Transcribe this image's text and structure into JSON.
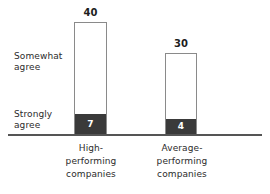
{
  "chart_data": {
    "type": "bar",
    "subtype": "stacked-bar",
    "title": "",
    "subtitle": "",
    "xlabel": "",
    "ylabel": "",
    "ylim": [
      0,
      45
    ],
    "grid": false,
    "legend_position": "left-axis-labels",
    "categories": [
      "High-performing companies",
      "Average-performing companies"
    ],
    "series": [
      {
        "name": "Strongly agree",
        "values": [
          7,
          4
        ],
        "color": "#3a3a3a"
      },
      {
        "name": "Somewhat agree",
        "values": [
          33,
          26
        ],
        "color": "#ffffff"
      }
    ],
    "totals": [
      40,
      30
    ],
    "annotations": {
      "total_labels": [
        "40",
        "30"
      ],
      "segment_labels": [
        "7",
        "4"
      ]
    }
  },
  "legend": {
    "somewhat": {
      "line1": "Somewhat",
      "line2": "agree"
    },
    "strongly": {
      "line1": "Strongly",
      "line2": "agree"
    }
  },
  "bars": {
    "bar1": {
      "total_label": "40",
      "bottom_value": "7",
      "category": {
        "line1": "High-",
        "line2": "performing",
        "line3": "companies"
      }
    },
    "bar2": {
      "total_label": "30",
      "bottom_value": "4",
      "category": {
        "line1": "Average-",
        "line2": "performing",
        "line3": "companies"
      }
    }
  },
  "colors": {
    "strongly_agree_fill": "#3a3a3a",
    "somewhat_agree_fill": "#ffffff",
    "bar_outline": "#8a8a8a",
    "axis_line": "#555555",
    "text": "#2b2b2b",
    "background": "#ffffff"
  }
}
